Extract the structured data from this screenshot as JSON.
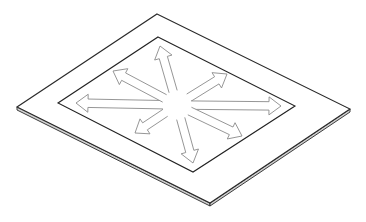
{
  "figure": {
    "colors": {
      "background": "#ffffff",
      "plate_outline": "#2a2a2a",
      "plate_edge_fill": "#cfcfcf",
      "inner_outline": "#222222",
      "arrow_outline": "#8a8a8a"
    },
    "plate": {
      "top": [
        157,
        14
      ],
      "right": [
        350,
        109
      ],
      "bottom": [
        210,
        203
      ],
      "left": [
        17,
        107
      ],
      "thickness": 3
    },
    "inner_rect": {
      "top": [
        158,
        37
      ],
      "right": [
        295,
        106
      ],
      "bottom": [
        193,
        172
      ],
      "left": [
        58,
        103
      ]
    },
    "arrows": {
      "center": [
        177,
        105
      ],
      "shaft_half_width": 4.2,
      "head_half_width": 9,
      "head_length": 12,
      "start_offset": 14,
      "tips": [
        {
          "name": "arrow-north",
          "tip": [
            160,
            46
          ]
        },
        {
          "name": "arrow-northeast",
          "tip": [
            227,
            74
          ]
        },
        {
          "name": "arrow-east",
          "tip": [
            281,
            106
          ]
        },
        {
          "name": "arrow-southeast",
          "tip": [
            242,
            136
          ]
        },
        {
          "name": "arrow-south",
          "tip": [
            193,
            163
          ]
        },
        {
          "name": "arrow-southwest",
          "tip": [
            135,
            133
          ]
        },
        {
          "name": "arrow-west",
          "tip": [
            76,
            103
          ]
        },
        {
          "name": "arrow-northwest",
          "tip": [
            113,
            71
          ]
        }
      ]
    }
  }
}
